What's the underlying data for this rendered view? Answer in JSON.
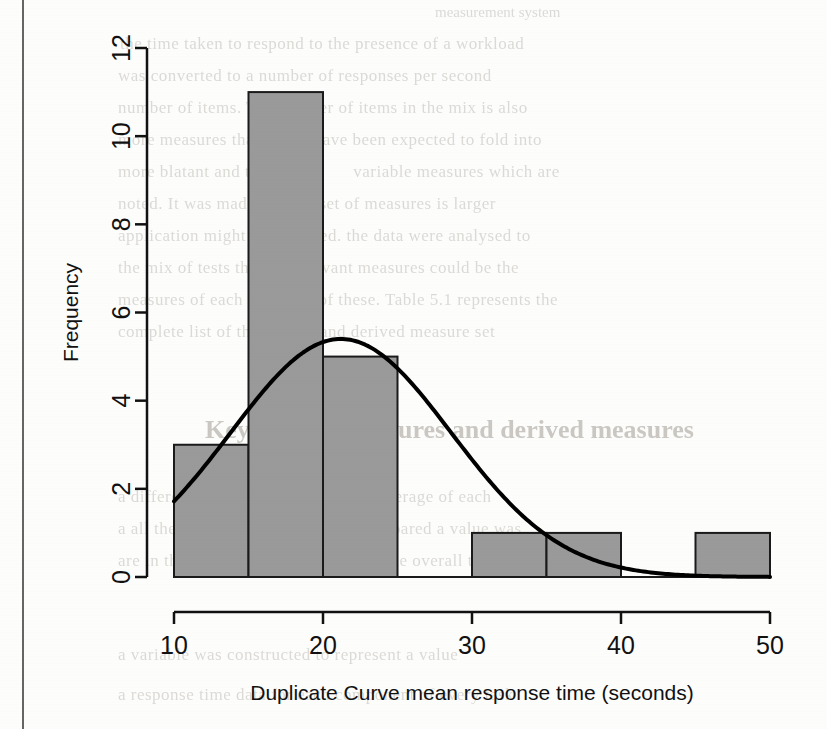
{
  "page": {
    "kind": "scanned-thesis-page",
    "edge_line_color": "#4a4a4a"
  },
  "background_text": {
    "note": "faint bleed-through text from reverse side of scanned page",
    "heading": "Key refined measures and derived measures",
    "lines": [
      "measurement system",
      "the time taken to respond to the presence of a workload",
      "was converted to a number of responses per second",
      "number of items. The number of items in the mix is also",
      "more measures that would have been expected to fold into",
      "more blatant and that                 variable measures which are",
      "noted. It was made that the set of measures is larger",
      "application might be expected. the data were analysed to",
      "the mix of tests that the relevant measures could be the",
      "measures of each and most of these. Table 5.1 represents the",
      "complete list of the refined and derived measure set",
      "a different number of trials and the average of each",
      "a all the response time data were compared a value was",
      "are in the same set that the response the overall timing",
      "a variable was constructed to represent a value",
      "a response time data for each component of every task"
    ]
  },
  "chart_data": {
    "type": "bar",
    "title": "",
    "subtitle": "",
    "xlabel": "Duplicate Curve mean response time (seconds)",
    "ylabel": "Frequency",
    "xlim": [
      10,
      50
    ],
    "ylim": [
      0,
      12
    ],
    "xticks": [
      10,
      20,
      30,
      40,
      50
    ],
    "yticks": [
      0,
      2,
      4,
      6,
      8,
      10,
      12
    ],
    "xtick_labels": [
      "10",
      "20",
      "30",
      "40",
      "50"
    ],
    "ytick_labels": [
      "0",
      "2",
      "4",
      "6",
      "8",
      "10",
      "12"
    ],
    "grid": false,
    "legend": false,
    "bin_width": 5,
    "bin_edges": [
      10,
      15,
      20,
      25,
      30,
      35,
      40,
      45,
      50
    ],
    "categories": [
      "10-15",
      "15-20",
      "20-25",
      "25-30",
      "30-35",
      "35-40",
      "40-45",
      "45-50"
    ],
    "values": [
      3,
      11,
      5,
      0,
      1,
      1,
      0,
      1
    ],
    "bar_fill": "#9a9a9a",
    "bar_stroke": "#1a1a1a",
    "overlay_curve": {
      "name": "normal density",
      "stroke": "#000000",
      "stroke_width": 4,
      "peak_x": 21.2,
      "peak_y": 5.4,
      "mean": 21.2,
      "sd": 7.4,
      "start_x": 10,
      "start_y": 1.45,
      "end_x": 50,
      "end_y": 0.0
    }
  }
}
